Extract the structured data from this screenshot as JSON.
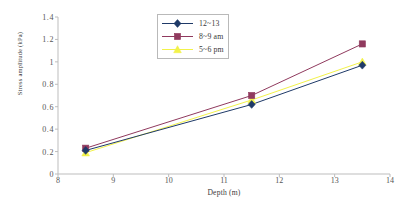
{
  "chart_data": {
    "type": "line",
    "title": "",
    "xlabel": "Depth (m)",
    "ylabel": "Stress amplitude (kPa)",
    "xlim": [
      8,
      14
    ],
    "ylim": [
      0,
      1.4
    ],
    "xticks": [
      "8",
      "9",
      "10",
      "11",
      "12",
      "13",
      "14"
    ],
    "yticks": [
      "0",
      "0.2",
      "0.4",
      "0.6",
      "0.8",
      "1",
      "1.2",
      "1.4"
    ],
    "x": [
      8.5,
      11.5,
      13.5
    ],
    "grid": false,
    "legend_position": "top-center",
    "series": [
      {
        "name": "12~13",
        "values": [
          0.21,
          0.62,
          0.97
        ],
        "color": "#1F3A68",
        "marker": "diamond"
      },
      {
        "name": "8~9 am",
        "values": [
          0.23,
          0.7,
          1.16
        ],
        "color": "#903A5E",
        "marker": "square"
      },
      {
        "name": "5~6 pm",
        "values": [
          0.19,
          0.66,
          1.0
        ],
        "color": "#F2F24A",
        "marker": "triangle"
      }
    ]
  }
}
